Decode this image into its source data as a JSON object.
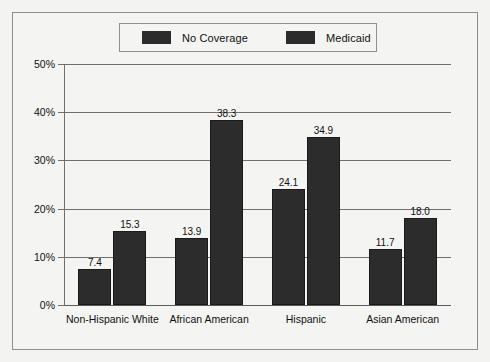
{
  "chart_data": {
    "type": "bar",
    "title": "",
    "subtitle": "",
    "xlabel": "",
    "ylabel": "",
    "categories": [
      "Non-Hispanic White",
      "African American",
      "Hispanic",
      "Asian American"
    ],
    "series": [
      {
        "name": "No Coverage",
        "values": [
          7.4,
          13.9,
          24.1,
          11.7
        ],
        "color": "#2c2c2c"
      },
      {
        "name": "Medicaid",
        "values": [
          15.3,
          38.3,
          34.9,
          18.0
        ],
        "color": "#2c2c2c"
      }
    ],
    "value_labels": [
      [
        "7.4",
        "15.3"
      ],
      [
        "13.9",
        "38.3"
      ],
      [
        "24.1",
        "34.9"
      ],
      [
        "11.7",
        "18.0"
      ]
    ],
    "ylim": [
      0,
      50
    ],
    "ytick_values": [
      0,
      10,
      20,
      30,
      40,
      50
    ],
    "ytick_labels": [
      "0%",
      "10%",
      "20%",
      "30%",
      "40%",
      "50%"
    ],
    "grid": true,
    "legend_position": "top-center",
    "legend_entries": [
      "No Coverage",
      "Medicaid"
    ]
  },
  "legend": {
    "entries": [
      {
        "label": "No Coverage",
        "swatch_color": "#2c2c2c"
      },
      {
        "label": "Medicaid",
        "swatch_color": "#2c2c2c"
      }
    ]
  },
  "axes": {
    "y_ticks": [
      {
        "label": "50%",
        "value": 50
      },
      {
        "label": "40%",
        "value": 40
      },
      {
        "label": "30%",
        "value": 30
      },
      {
        "label": "20%",
        "value": 20
      },
      {
        "label": "10%",
        "value": 10
      },
      {
        "label": "0%",
        "value": 0
      }
    ],
    "x_categories": [
      {
        "label": "Non-Hispanic White"
      },
      {
        "label": "African American"
      },
      {
        "label": "Hispanic"
      },
      {
        "label": "Asian American"
      }
    ]
  },
  "colors": {
    "bar": "#2c2c2c",
    "grid": "#6f6f6f",
    "frame": "#8d8d8d",
    "background": "#f4f4f2",
    "text": "#111111"
  }
}
